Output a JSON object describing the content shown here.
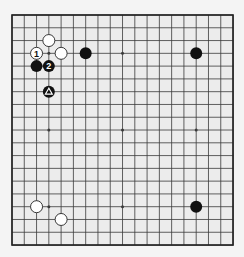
{
  "board": {
    "size": 19,
    "origin_x": 12,
    "origin_y": 15,
    "spacing_x": 12.28,
    "spacing_y": 12.78,
    "stone_radius": 6,
    "colors": {
      "background": "#f4f4f4",
      "board_fill": "#ececec",
      "grid_line": "#3a3a3a",
      "border_line": "#222222",
      "black_stone": "#111111",
      "white_stone": "#ffffff",
      "white_stone_outline": "#222222"
    },
    "star_points": [
      [
        3,
        3
      ],
      [
        9,
        3
      ],
      [
        15,
        3
      ],
      [
        3,
        9
      ],
      [
        9,
        9
      ],
      [
        15,
        9
      ],
      [
        3,
        15
      ],
      [
        9,
        15
      ],
      [
        15,
        15
      ]
    ],
    "stones": [
      {
        "color": "white",
        "col": 3,
        "row": 2,
        "label": ""
      },
      {
        "color": "white",
        "col": 2,
        "row": 3,
        "label": "1"
      },
      {
        "color": "white",
        "col": 4,
        "row": 3,
        "label": ""
      },
      {
        "color": "black",
        "col": 6,
        "row": 3,
        "label": ""
      },
      {
        "color": "black",
        "col": 2,
        "row": 4,
        "label": ""
      },
      {
        "color": "black",
        "col": 3,
        "row": 4,
        "label": "2"
      },
      {
        "color": "black",
        "col": 3,
        "row": 6,
        "label": "triangle"
      },
      {
        "color": "black",
        "col": 15,
        "row": 3,
        "label": ""
      },
      {
        "color": "white",
        "col": 2,
        "row": 15,
        "label": ""
      },
      {
        "color": "white",
        "col": 4,
        "row": 16,
        "label": ""
      },
      {
        "color": "black",
        "col": 15,
        "row": 15,
        "label": ""
      }
    ]
  }
}
